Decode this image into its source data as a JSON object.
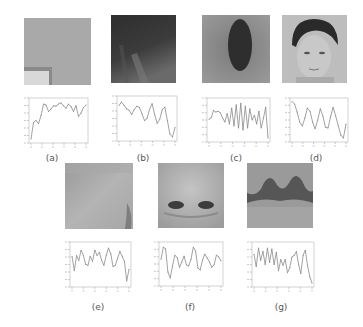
{
  "figure": {
    "panels": [
      {
        "id": "a",
        "label": "(a)",
        "image_desc": "flat gray background patch with light rectangle at lower-left",
        "image_colors": {
          "base": "#a9a9a9",
          "accent": "#d8d8d8",
          "edge": "#8a8a8a"
        }
      },
      {
        "id": "b",
        "label": "(b)",
        "image_desc": "dark textured hair-like patch",
        "image_colors": {
          "base": "#3a3a3a",
          "accent": "#8a8a8a",
          "edge": "#222222"
        }
      },
      {
        "id": "c",
        "label": "(c)",
        "image_desc": "gray patch with dark vertical oval (mouth/throat)",
        "image_colors": {
          "base": "#8e8e8e",
          "accent": "#2e2e2e",
          "edge": "#6a6a6a"
        }
      },
      {
        "id": "d",
        "label": "(d)",
        "image_desc": "frontal face of a young man with dark hair",
        "image_colors": {
          "base": "#bdbdbd",
          "accent": "#2a2a2a",
          "edge": "#9a9a9a"
        }
      },
      {
        "id": "e",
        "label": "(e)",
        "image_desc": "light gray skin patch (cheek)",
        "image_colors": {
          "base": "#a4a4a4",
          "accent": "#c2c2c2",
          "edge": "#7e7e7e"
        }
      },
      {
        "id": "f",
        "label": "(f)",
        "image_desc": "nose patch with two dark nostrils",
        "image_colors": {
          "base": "#b0b0b0",
          "accent": "#3c3c3c",
          "edge": "#8c8c8c"
        }
      },
      {
        "id": "g",
        "label": "(g)",
        "image_desc": "upper lip / mouth patch with dark wavy band",
        "image_colors": {
          "base": "#9a9a9a",
          "accent": "#4a4a4a",
          "edge": "#787878"
        }
      }
    ]
  },
  "chart_data": [
    {
      "type": "line",
      "panel": "a",
      "title": "",
      "xlabel": "",
      "ylabel": "",
      "ylim": [
        0,
        1
      ],
      "grid": false,
      "values": [
        0.05,
        0.45,
        0.5,
        0.42,
        0.62,
        0.9,
        0.88,
        0.72,
        0.78,
        0.86,
        0.85,
        0.9,
        0.93,
        0.86,
        0.8,
        0.9,
        0.84,
        0.72,
        0.86,
        0.6,
        0.68,
        0.82,
        0.88
      ]
    },
    {
      "type": "line",
      "panel": "b",
      "title": "",
      "xlabel": "",
      "ylabel": "",
      "ylim": [
        0,
        1
      ],
      "grid": false,
      "values": [
        0.82,
        0.9,
        0.82,
        0.74,
        0.7,
        0.6,
        0.72,
        0.8,
        0.77,
        0.62,
        0.45,
        0.5,
        0.72,
        0.86,
        0.6,
        0.38,
        0.48,
        0.72,
        0.78,
        0.45,
        0.12,
        0.05,
        0.28
      ]
    },
    {
      "type": "line",
      "panel": "c",
      "title": "",
      "xlabel": "",
      "ylabel": "",
      "ylim": [
        0,
        1
      ],
      "grid": false,
      "values": [
        0.52,
        0.56,
        0.74,
        0.7,
        0.72,
        0.68,
        0.55,
        0.45,
        0.66,
        0.4,
        0.8,
        0.35,
        0.88,
        0.3,
        0.92,
        0.25,
        0.85,
        0.3,
        0.78,
        0.5,
        0.62,
        0.4,
        0.72,
        0.3,
        0.55,
        0.82,
        0.05
      ]
    },
    {
      "type": "line",
      "panel": "d",
      "title": "",
      "xlabel": "",
      "ylabel": "",
      "ylim": [
        0,
        1
      ],
      "grid": false,
      "values": [
        0.96,
        0.9,
        0.7,
        0.45,
        0.35,
        0.55,
        0.8,
        0.72,
        0.45,
        0.28,
        0.5,
        0.78,
        0.6,
        0.32,
        0.3,
        0.58,
        0.82,
        0.6,
        0.35,
        0.12,
        0.05,
        0.4
      ]
    },
    {
      "type": "line",
      "panel": "e",
      "title": "",
      "xlabel": "",
      "ylabel": "",
      "ylim": [
        0,
        1
      ],
      "grid": false,
      "values": [
        0.7,
        0.35,
        0.72,
        0.6,
        0.85,
        0.72,
        0.5,
        0.48,
        0.7,
        0.58,
        0.85,
        0.72,
        0.8,
        0.6,
        0.48,
        0.72,
        0.9,
        0.76,
        0.45,
        0.48,
        0.65,
        0.82,
        0.7,
        0.58,
        0.1,
        0.38
      ]
    },
    {
      "type": "line",
      "panel": "f",
      "title": "",
      "xlabel": "",
      "ylabel": "",
      "ylim": [
        0,
        1
      ],
      "grid": false,
      "values": [
        0.62,
        0.92,
        0.88,
        0.3,
        0.15,
        0.45,
        0.72,
        0.66,
        0.42,
        0.55,
        0.7,
        0.48,
        0.45,
        0.62,
        0.92,
        0.82,
        0.4,
        0.35,
        0.6,
        0.75,
        0.65,
        0.55,
        0.42,
        0.48,
        0.72,
        0.68,
        0.58
      ]
    },
    {
      "type": "line",
      "panel": "g",
      "title": "",
      "xlabel": "",
      "ylabel": "",
      "ylim": [
        0,
        1
      ],
      "grid": false,
      "values": [
        0.75,
        0.45,
        0.9,
        0.6,
        0.82,
        0.5,
        0.9,
        0.55,
        0.88,
        0.5,
        0.8,
        0.35,
        0.62,
        0.48,
        0.62,
        0.3,
        0.42,
        0.68,
        0.72,
        0.82,
        0.5,
        0.28,
        0.72,
        0.85,
        0.48,
        0.2,
        0.05
      ]
    }
  ]
}
